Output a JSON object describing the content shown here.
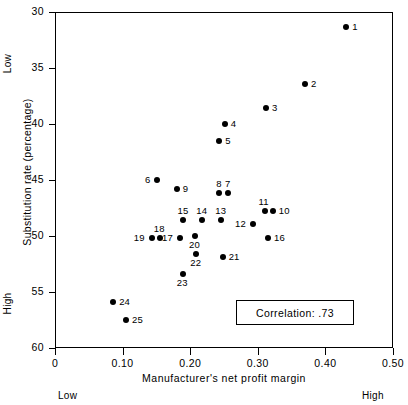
{
  "chart_data": {
    "type": "scatter",
    "title": "",
    "xlabel": "Manufacturer's net profit margin",
    "ylabel": "Substitution rate (percentage)",
    "xlim": [
      0,
      0.5
    ],
    "ylim": [
      60,
      30
    ],
    "y_inverted": true,
    "grid": false,
    "legend": "none",
    "xticks": [
      {
        "value": 0,
        "label": "0"
      },
      {
        "value": 0.1,
        "label": "0.10"
      },
      {
        "value": 0.2,
        "label": "0.20"
      },
      {
        "value": 0.3,
        "label": "0.30"
      },
      {
        "value": 0.4,
        "label": "0.40"
      },
      {
        "value": 0.5,
        "label": "0.50"
      }
    ],
    "yticks": [
      {
        "value": 30,
        "label": "30"
      },
      {
        "value": 35,
        "label": "35"
      },
      {
        "value": 40,
        "label": "40"
      },
      {
        "value": 45,
        "label": "45"
      },
      {
        "value": 50,
        "label": "50"
      },
      {
        "value": 55,
        "label": "55"
      },
      {
        "value": 60,
        "label": "60"
      }
    ],
    "axis_direction_labels": {
      "y_top": "Low",
      "y_bottom": "High",
      "x_left": "Low",
      "x_right": "High"
    },
    "annotations": [
      {
        "name": "correlation-box",
        "text": "Correlation: .73"
      }
    ],
    "points": [
      {
        "label": "1",
        "x": 0.431,
        "y": 31.3,
        "label_pos": "right"
      },
      {
        "label": "2",
        "x": 0.37,
        "y": 36.4,
        "label_pos": "right"
      },
      {
        "label": "3",
        "x": 0.312,
        "y": 38.6,
        "label_pos": "right"
      },
      {
        "label": "4",
        "x": 0.251,
        "y": 40.0,
        "label_pos": "right"
      },
      {
        "label": "5",
        "x": 0.243,
        "y": 41.5,
        "label_pos": "right"
      },
      {
        "label": "6",
        "x": 0.151,
        "y": 45.0,
        "label_pos": "left"
      },
      {
        "label": "7",
        "x": 0.256,
        "y": 46.2,
        "label_pos": "top"
      },
      {
        "label": "8",
        "x": 0.243,
        "y": 46.2,
        "label_pos": "top"
      },
      {
        "label": "9",
        "x": 0.18,
        "y": 45.8,
        "label_pos": "right"
      },
      {
        "label": "10",
        "x": 0.322,
        "y": 47.8,
        "label_pos": "right"
      },
      {
        "label": "11",
        "x": 0.31,
        "y": 47.8,
        "label_pos": "top"
      },
      {
        "label": "12",
        "x": 0.293,
        "y": 48.9,
        "label_pos": "left"
      },
      {
        "label": "13",
        "x": 0.246,
        "y": 48.6,
        "label_pos": "top"
      },
      {
        "label": "14",
        "x": 0.218,
        "y": 48.6,
        "label_pos": "top"
      },
      {
        "label": "15",
        "x": 0.19,
        "y": 48.6,
        "label_pos": "top"
      },
      {
        "label": "16",
        "x": 0.315,
        "y": 50.2,
        "label_pos": "right"
      },
      {
        "label": "17",
        "x": 0.185,
        "y": 50.2,
        "label_pos": "left"
      },
      {
        "label": "18",
        "x": 0.155,
        "y": 50.2,
        "label_pos": "top"
      },
      {
        "label": "19",
        "x": 0.143,
        "y": 50.2,
        "label_pos": "left"
      },
      {
        "label": "20",
        "x": 0.207,
        "y": 50.0,
        "label_pos": "bottom"
      },
      {
        "label": "21",
        "x": 0.248,
        "y": 51.9,
        "label_pos": "right"
      },
      {
        "label": "22",
        "x": 0.209,
        "y": 51.6,
        "label_pos": "bottom"
      },
      {
        "label": "23",
        "x": 0.189,
        "y": 53.4,
        "label_pos": "bottom"
      },
      {
        "label": "24",
        "x": 0.086,
        "y": 55.9,
        "label_pos": "right"
      },
      {
        "label": "25",
        "x": 0.105,
        "y": 57.5,
        "label_pos": "right"
      }
    ]
  }
}
